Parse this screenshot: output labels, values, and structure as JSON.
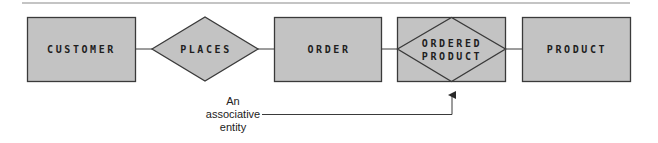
{
  "diagram": {
    "type": "entity-relationship",
    "entities": [
      {
        "id": "customer",
        "label": "CUSTOMER",
        "kind": "entity"
      },
      {
        "id": "order",
        "label": "ORDER",
        "kind": "entity"
      },
      {
        "id": "ordered_product",
        "label_line1": "ORDERED",
        "label_line2": "PRODUCT",
        "kind": "associative-entity"
      },
      {
        "id": "product",
        "label": "PRODUCT",
        "kind": "entity"
      }
    ],
    "relationships": [
      {
        "id": "places",
        "label": "PLACES",
        "connects": [
          "customer",
          "order"
        ]
      }
    ],
    "annotation": {
      "line1": "An",
      "line2": "associative",
      "line3": "entity",
      "points_to": "ordered_product"
    },
    "colors": {
      "shape_fill": "#c3c3c3",
      "stroke": "#3a3a3a",
      "text": "#1e1e1e"
    }
  }
}
